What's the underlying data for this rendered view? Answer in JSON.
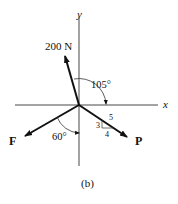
{
  "figure": {
    "caption": "(b)",
    "axes": {
      "x_label": "x",
      "y_label": "y"
    },
    "forces": [
      {
        "name": "200 N",
        "label": "200 N"
      },
      {
        "name": "F",
        "label": "F"
      },
      {
        "name": "P",
        "label": "P"
      }
    ],
    "angles": {
      "angle_200N": "105°",
      "angle_F": "60°"
    },
    "slope_triangle": {
      "rise": "3",
      "run": "4",
      "hyp": "5"
    }
  }
}
